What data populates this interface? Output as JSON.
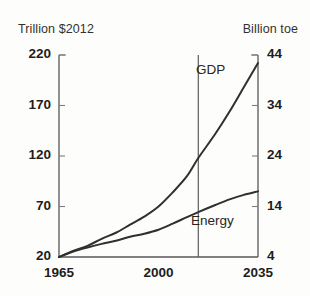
{
  "chart_data": {
    "type": "line",
    "title": "",
    "xlabel": "",
    "ylabel": "Trillion $2012",
    "y2label": "Billion toe",
    "xlim": [
      1965,
      2035
    ],
    "ylim": [
      20,
      220
    ],
    "y2lim": [
      4,
      44
    ],
    "grid": false,
    "legend_position": "inline-annotation",
    "x_ticks": [
      "1965",
      "2000",
      "2035"
    ],
    "x_tick_values": [
      1965,
      2000,
      2035
    ],
    "y_ticks": [
      "20",
      "70",
      "120",
      "170",
      "220"
    ],
    "y_tick_values": [
      20,
      70,
      120,
      170,
      220
    ],
    "y2_ticks": [
      "4",
      "14",
      "24",
      "34",
      "44"
    ],
    "y2_tick_values": [
      4,
      14,
      24,
      34,
      44
    ],
    "annotations": [
      {
        "text": "GDP",
        "x": 2020,
        "y": 190
      },
      {
        "text": "Energy",
        "x": 2019,
        "y": 72
      }
    ],
    "divider_line": {
      "x": 2014,
      "label": ""
    },
    "series": [
      {
        "name": "GDP",
        "axis": "left",
        "unit": "Trillion $2012",
        "x": [
          1965,
          1970,
          1975,
          1980,
          1985,
          1990,
          1995,
          2000,
          2005,
          2010,
          2014,
          2020,
          2025,
          2030,
          2035
        ],
        "values": [
          20,
          26,
          31,
          38,
          44,
          52,
          60,
          70,
          84,
          100,
          118,
          142,
          164,
          188,
          212
        ]
      },
      {
        "name": "Energy",
        "axis": "right",
        "unit": "Billion toe",
        "x": [
          1965,
          1970,
          1975,
          1980,
          1985,
          1990,
          1995,
          2000,
          2005,
          2010,
          2014,
          2020,
          2025,
          2030,
          2035
        ],
        "values": [
          4,
          5.1,
          5.9,
          6.6,
          7.2,
          8.0,
          8.6,
          9.4,
          10.6,
          11.9,
          12.9,
          14.3,
          15.4,
          16.3,
          17.0
        ]
      }
    ]
  },
  "labels": {
    "unit_left": "Trillion $2012",
    "unit_right": "Billion toe"
  }
}
